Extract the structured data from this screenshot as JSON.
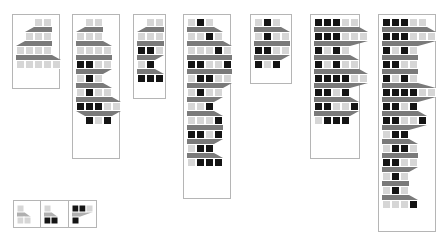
{
  "figure": {
    "title": "",
    "background": "#ffffff",
    "panel_border_color": "#b5b5b5",
    "cell_colors": {
      "light": "#d6d6d6",
      "mid": "#7a7a7a",
      "dark": "#141414",
      "connector": "#7a7a7a",
      "connector_light": "#b0b0b0",
      "cell_border": "#ffffff"
    },
    "cell_size": 9
  },
  "panels": [
    {
      "name": "panel-1",
      "x": 12,
      "y": 14,
      "w": 48,
      "h": 75,
      "rows": [
        {
          "indent": 2,
          "y": 3,
          "cells": [
            "light",
            "light"
          ]
        },
        {
          "indent": 1,
          "y": 17,
          "cells": [
            "light",
            "light",
            "light"
          ]
        },
        {
          "indent": 0,
          "y": 31,
          "cells": [
            "light",
            "light",
            "light",
            "light"
          ]
        },
        {
          "indent": 0,
          "y": 45,
          "cells": [
            "light",
            "light",
            "light",
            "light",
            "light"
          ]
        }
      ],
      "connectors": [
        {
          "from_row": 0,
          "to_row": 1
        },
        {
          "from_row": 1,
          "to_row": 2
        },
        {
          "from_row": 2,
          "to_row": 3
        }
      ]
    },
    {
      "name": "panel-2",
      "x": 72,
      "y": 14,
      "w": 48,
      "h": 145,
      "rows": [
        {
          "indent": 1,
          "y": 3,
          "cells": [
            "light",
            "light"
          ]
        },
        {
          "indent": 0,
          "y": 17,
          "cells": [
            "light",
            "light",
            "light"
          ]
        },
        {
          "indent": 0,
          "y": 31,
          "cells": [
            "light",
            "light",
            "light",
            "light"
          ]
        },
        {
          "indent": 0,
          "y": 45,
          "cells": [
            "dark",
            "dark",
            "light",
            "light"
          ]
        },
        {
          "indent": 0,
          "y": 59,
          "cells": [
            "light",
            "dark",
            "light"
          ]
        },
        {
          "indent": 0,
          "y": 73,
          "cells": [
            "light",
            "dark",
            "light",
            "light"
          ]
        },
        {
          "indent": 0,
          "y": 87,
          "cells": [
            "dark",
            "dark",
            "dark",
            "light",
            "light"
          ]
        },
        {
          "indent": 1,
          "y": 101,
          "cells": [
            "dark",
            "light",
            "dark"
          ]
        }
      ],
      "connectors": [
        {
          "from_row": 0,
          "to_row": 1
        },
        {
          "from_row": 1,
          "to_row": 2
        },
        {
          "from_row": 2,
          "to_row": 3
        },
        {
          "from_row": 3,
          "to_row": 4
        },
        {
          "from_row": 4,
          "to_row": 5
        },
        {
          "from_row": 5,
          "to_row": 6
        },
        {
          "from_row": 6,
          "to_row": 7
        }
      ]
    },
    {
      "name": "panel-3",
      "x": 133,
      "y": 14,
      "w": 33,
      "h": 85,
      "rows": [
        {
          "indent": 1,
          "y": 3,
          "cells": [
            "light",
            "light"
          ]
        },
        {
          "indent": 0,
          "y": 17,
          "cells": [
            "light",
            "light",
            "light"
          ]
        },
        {
          "indent": 0,
          "y": 31,
          "cells": [
            "dark",
            "dark",
            "light"
          ]
        },
        {
          "indent": 0,
          "y": 45,
          "cells": [
            "light",
            "dark"
          ]
        },
        {
          "indent": 0,
          "y": 59,
          "cells": [
            "dark",
            "dark",
            "dark"
          ]
        }
      ],
      "connectors": [
        {
          "from_row": 0,
          "to_row": 1
        },
        {
          "from_row": 1,
          "to_row": 2
        },
        {
          "from_row": 2,
          "to_row": 3
        },
        {
          "from_row": 3,
          "to_row": 4
        }
      ]
    },
    {
      "name": "panel-4",
      "x": 183,
      "y": 14,
      "w": 48,
      "h": 185,
      "rows": [
        {
          "indent": 0,
          "y": 3,
          "cells": [
            "light",
            "dark",
            "light"
          ]
        },
        {
          "indent": 0,
          "y": 17,
          "cells": [
            "light",
            "light",
            "dark",
            "light"
          ]
        },
        {
          "indent": 0,
          "y": 31,
          "cells": [
            "light",
            "light",
            "light",
            "dark",
            "light"
          ]
        },
        {
          "indent": 0,
          "y": 45,
          "cells": [
            "dark",
            "dark",
            "light",
            "light",
            "dark"
          ]
        },
        {
          "indent": 0,
          "y": 59,
          "cells": [
            "light",
            "dark",
            "dark",
            "light",
            "light"
          ]
        },
        {
          "indent": 0,
          "y": 73,
          "cells": [
            "light",
            "dark",
            "light",
            "light"
          ]
        },
        {
          "indent": 0,
          "y": 87,
          "cells": [
            "light",
            "light",
            "dark"
          ]
        },
        {
          "indent": 0,
          "y": 101,
          "cells": [
            "light",
            "light",
            "light",
            "dark"
          ]
        },
        {
          "indent": 0,
          "y": 115,
          "cells": [
            "dark",
            "dark",
            "light",
            "dark"
          ]
        },
        {
          "indent": 0,
          "y": 129,
          "cells": [
            "light",
            "dark",
            "dark"
          ]
        },
        {
          "indent": 0,
          "y": 143,
          "cells": [
            "light",
            "dark",
            "dark",
            "dark"
          ]
        }
      ],
      "connectors": [
        {
          "from_row": 0,
          "to_row": 1
        },
        {
          "from_row": 1,
          "to_row": 2
        },
        {
          "from_row": 2,
          "to_row": 3
        },
        {
          "from_row": 3,
          "to_row": 4
        },
        {
          "from_row": 4,
          "to_row": 5
        },
        {
          "from_row": 5,
          "to_row": 6
        },
        {
          "from_row": 6,
          "to_row": 7
        },
        {
          "from_row": 7,
          "to_row": 8
        },
        {
          "from_row": 8,
          "to_row": 9
        },
        {
          "from_row": 9,
          "to_row": 10
        }
      ]
    },
    {
      "name": "panel-5",
      "x": 250,
      "y": 14,
      "w": 42,
      "h": 70,
      "rows": [
        {
          "indent": 0,
          "y": 3,
          "cells": [
            "light",
            "dark",
            "light"
          ]
        },
        {
          "indent": 0,
          "y": 17,
          "cells": [
            "light",
            "dark",
            "light",
            "light"
          ]
        },
        {
          "indent": 0,
          "y": 31,
          "cells": [
            "dark",
            "dark",
            "light",
            "light"
          ]
        },
        {
          "indent": 0,
          "y": 45,
          "cells": [
            "dark",
            "light",
            "dark"
          ]
        }
      ],
      "connectors": [
        {
          "from_row": 0,
          "to_row": 1
        },
        {
          "from_row": 1,
          "to_row": 2
        },
        {
          "from_row": 2,
          "to_row": 3
        }
      ]
    },
    {
      "name": "panel-6",
      "x": 310,
      "y": 14,
      "w": 50,
      "h": 145,
      "rows": [
        {
          "indent": 0,
          "y": 3,
          "cells": [
            "dark",
            "dark",
            "dark",
            "light",
            "light"
          ]
        },
        {
          "indent": 0,
          "y": 17,
          "cells": [
            "dark",
            "dark",
            "dark",
            "light",
            "light",
            "light"
          ]
        },
        {
          "indent": 0,
          "y": 31,
          "cells": [
            "dark",
            "light",
            "dark",
            "light"
          ]
        },
        {
          "indent": 0,
          "y": 45,
          "cells": [
            "dark",
            "light",
            "dark",
            "light",
            "light"
          ]
        },
        {
          "indent": 0,
          "y": 59,
          "cells": [
            "dark",
            "dark",
            "dark",
            "dark",
            "light",
            "light"
          ]
        },
        {
          "indent": 0,
          "y": 73,
          "cells": [
            "dark",
            "dark",
            "light",
            "dark"
          ]
        },
        {
          "indent": 0,
          "y": 87,
          "cells": [
            "dark",
            "dark",
            "light",
            "light",
            "dark"
          ]
        },
        {
          "indent": 0,
          "y": 101,
          "cells": [
            "light",
            "dark",
            "dark",
            "dark"
          ]
        }
      ],
      "connectors": [
        {
          "from_row": 0,
          "to_row": 1
        },
        {
          "from_row": 1,
          "to_row": 2
        },
        {
          "from_row": 2,
          "to_row": 3
        },
        {
          "from_row": 3,
          "to_row": 4
        },
        {
          "from_row": 4,
          "to_row": 5
        },
        {
          "from_row": 5,
          "to_row": 6
        },
        {
          "from_row": 6,
          "to_row": 7
        }
      ]
    },
    {
      "name": "panel-7",
      "x": 378,
      "y": 14,
      "w": 58,
      "h": 218,
      "rows": [
        {
          "indent": 0,
          "y": 3,
          "cells": [
            "dark",
            "dark",
            "dark",
            "light",
            "light"
          ]
        },
        {
          "indent": 0,
          "y": 17,
          "cells": [
            "dark",
            "dark",
            "dark",
            "light",
            "light",
            "light"
          ]
        },
        {
          "indent": 0,
          "y": 31,
          "cells": [
            "dark",
            "light",
            "dark",
            "light"
          ]
        },
        {
          "indent": 0,
          "y": 45,
          "cells": [
            "dark",
            "dark",
            "light",
            "light"
          ]
        },
        {
          "indent": 0,
          "y": 59,
          "cells": [
            "dark",
            "light",
            "dark",
            "light"
          ]
        },
        {
          "indent": 0,
          "y": 73,
          "cells": [
            "dark",
            "dark",
            "dark",
            "dark",
            "light",
            "light"
          ]
        },
        {
          "indent": 0,
          "y": 87,
          "cells": [
            "dark",
            "dark",
            "light",
            "dark"
          ]
        },
        {
          "indent": 0,
          "y": 101,
          "cells": [
            "dark",
            "dark",
            "light",
            "light",
            "dark"
          ]
        },
        {
          "indent": 0,
          "y": 115,
          "cells": [
            "light",
            "dark",
            "dark"
          ]
        },
        {
          "indent": 0,
          "y": 129,
          "cells": [
            "light",
            "dark",
            "dark",
            "light"
          ]
        },
        {
          "indent": 0,
          "y": 143,
          "cells": [
            "dark",
            "dark",
            "light",
            "light"
          ]
        },
        {
          "indent": 0,
          "y": 157,
          "cells": [
            "light",
            "dark",
            "light"
          ]
        },
        {
          "indent": 0,
          "y": 171,
          "cells": [
            "light",
            "dark",
            "light"
          ]
        },
        {
          "indent": 0,
          "y": 185,
          "cells": [
            "light",
            "light",
            "light",
            "dark"
          ]
        }
      ],
      "connectors": [
        {
          "from_row": 0,
          "to_row": 1
        },
        {
          "from_row": 1,
          "to_row": 2
        },
        {
          "from_row": 2,
          "to_row": 3
        },
        {
          "from_row": 3,
          "to_row": 4
        },
        {
          "from_row": 4,
          "to_row": 5
        },
        {
          "from_row": 5,
          "to_row": 6
        },
        {
          "from_row": 6,
          "to_row": 7
        },
        {
          "from_row": 7,
          "to_row": 8
        },
        {
          "from_row": 8,
          "to_row": 9
        },
        {
          "from_row": 9,
          "to_row": 10
        },
        {
          "from_row": 10,
          "to_row": 11
        },
        {
          "from_row": 11,
          "to_row": 12
        },
        {
          "from_row": 12,
          "to_row": 13
        }
      ]
    }
  ],
  "legend": {
    "name": "legend-box",
    "x": 13,
    "y": 200,
    "w": 84,
    "h": 28,
    "items": [
      {
        "name": "legend-item-light",
        "label": "",
        "top_cells": [
          "light"
        ],
        "bottom_cells": [
          "light",
          "light"
        ]
      },
      {
        "name": "legend-item-mixed",
        "label": "",
        "top_cells": [
          "light"
        ],
        "bottom_cells": [
          "dark",
          "dark"
        ]
      },
      {
        "name": "legend-item-dark",
        "label": "",
        "top_cells": [
          "dark",
          "dark",
          "light"
        ],
        "bottom_cells": [
          "dark"
        ]
      }
    ]
  }
}
